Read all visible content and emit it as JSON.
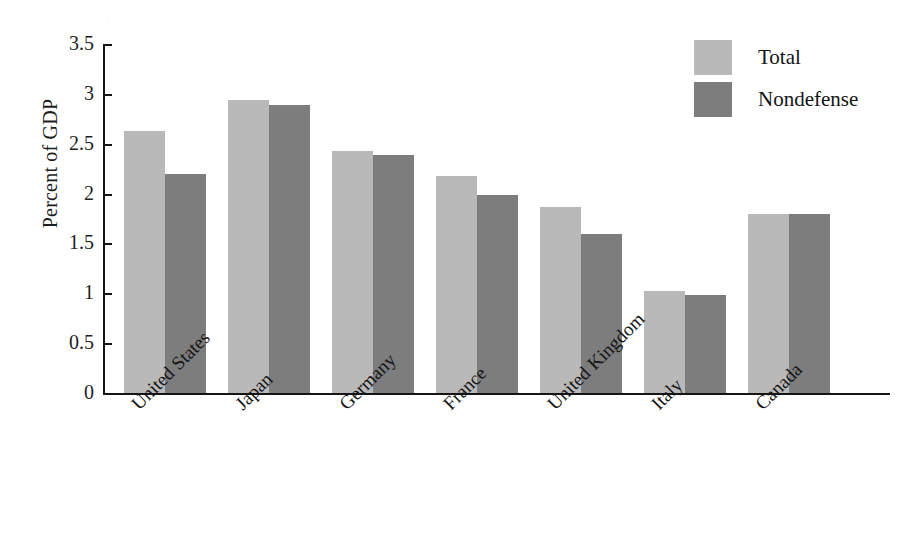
{
  "chart_data": {
    "type": "bar",
    "title": "",
    "subtitle": "",
    "xlabel": "",
    "ylabel": "Percent of GDP",
    "ylim": [
      0,
      3.5
    ],
    "ytick_labels": [
      "3.5",
      "3",
      "2.5",
      "2",
      "1.5",
      "1",
      "0.5",
      "0"
    ],
    "ytick_values": [
      3.5,
      3,
      2.5,
      2,
      1.5,
      1,
      0.5,
      0
    ],
    "grid": false,
    "legend_position": "top-right",
    "categories": [
      "United States",
      "Japan",
      "Germany",
      "France",
      "United Kingdom",
      "Italy",
      "Canada"
    ],
    "series": [
      {
        "name": "Total",
        "color": "#b9b9b9",
        "values": [
          2.63,
          2.94,
          2.43,
          2.18,
          1.87,
          1.02,
          1.8
        ]
      },
      {
        "name": "Nondefense",
        "color": "#7d7d7d",
        "values": [
          2.2,
          2.89,
          2.39,
          1.99,
          1.59,
          0.98,
          1.8
        ]
      }
    ]
  },
  "legend": {
    "items": [
      {
        "label": "Total",
        "color": "#b9b9b9"
      },
      {
        "label": "Nondefense",
        "color": "#7d7d7d"
      }
    ]
  },
  "axis": {
    "axis_color": "#151515"
  }
}
